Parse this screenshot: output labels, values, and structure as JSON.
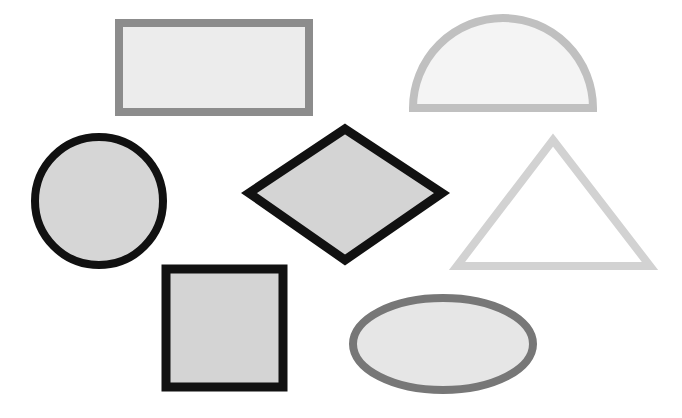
{
  "canvas": {
    "width": 682,
    "height": 418,
    "background": "#ffffff"
  },
  "shapes": [
    {
      "name": "rectangle",
      "x": 119,
      "y": 23,
      "w": 190,
      "h": 89,
      "stroke": "#8c8c8c",
      "fill": "#ececec",
      "strokeWidth": 8
    },
    {
      "name": "half-circle",
      "cx": 503,
      "cy": 108,
      "r": 90,
      "stroke": "#c0c0c0",
      "fill": "#f4f4f4",
      "strokeWidth": 8
    },
    {
      "name": "circle",
      "cx": 99,
      "cy": 201,
      "r": 64,
      "stroke": "#111111",
      "fill": "#d6d6d6",
      "strokeWidth": 8
    },
    {
      "name": "diamond",
      "points": [
        [
          345,
          129
        ],
        [
          442,
          193
        ],
        [
          345,
          260
        ],
        [
          249,
          193
        ]
      ],
      "stroke": "#111111",
      "fill": "#d4d4d4",
      "strokeWidth": 9
    },
    {
      "name": "triangle",
      "points": [
        [
          553,
          140
        ],
        [
          650,
          266
        ],
        [
          457,
          266
        ]
      ],
      "stroke": "#d2d2d2",
      "fill": "#ffffff",
      "strokeWidth": 8
    },
    {
      "name": "square",
      "x": 166,
      "y": 269,
      "w": 117,
      "h": 118,
      "stroke": "#111111",
      "fill": "#d4d4d4",
      "strokeWidth": 9
    },
    {
      "name": "ellipse",
      "cx": 443,
      "cy": 344,
      "rx": 90,
      "ry": 46,
      "stroke": "#777777",
      "fill": "#e6e6e6",
      "strokeWidth": 8
    }
  ]
}
